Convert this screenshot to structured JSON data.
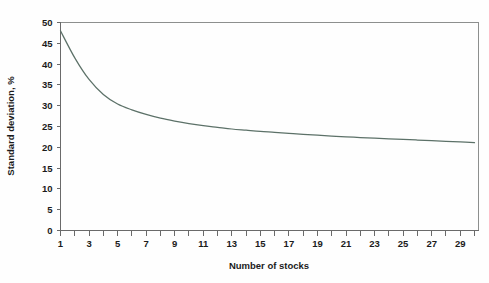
{
  "chart_data": {
    "type": "line",
    "title": "",
    "xlabel": "Number of stocks",
    "ylabel": "Standard deviation, %",
    "xlim": [
      1,
      30
    ],
    "ylim": [
      0,
      50
    ],
    "grid": false,
    "legend": null,
    "series_color": "#5c7168",
    "x": [
      1,
      2,
      3,
      4,
      5,
      6,
      7,
      8,
      9,
      10,
      11,
      12,
      13,
      14,
      15,
      16,
      17,
      18,
      19,
      20,
      21,
      22,
      23,
      24,
      25,
      26,
      27,
      28,
      29,
      30
    ],
    "values": [
      48.0,
      41.5,
      36.3,
      32.7,
      30.4,
      29.0,
      27.9,
      27.0,
      26.3,
      25.7,
      25.2,
      24.8,
      24.4,
      24.1,
      23.8,
      23.6,
      23.35,
      23.1,
      22.9,
      22.7,
      22.5,
      22.35,
      22.2,
      22.05,
      21.9,
      21.75,
      21.6,
      21.45,
      21.3,
      21.1
    ],
    "series": [
      {
        "name": "Portfolio standard deviation",
        "values": [
          48.0,
          41.5,
          36.3,
          32.7,
          30.4,
          29.0,
          27.9,
          27.0,
          26.3,
          25.7,
          25.2,
          24.8,
          24.4,
          24.1,
          23.8,
          23.6,
          23.35,
          23.1,
          22.9,
          22.7,
          22.5,
          22.35,
          22.2,
          22.05,
          21.9,
          21.75,
          21.6,
          21.45,
          21.3,
          21.1
        ]
      }
    ],
    "yticks": [
      0,
      5,
      10,
      15,
      20,
      25,
      30,
      35,
      40,
      45,
      50
    ],
    "ytick_labels": [
      "0",
      "5",
      "10",
      "15",
      "20",
      "25",
      "30",
      "35",
      "40",
      "45",
      "50"
    ],
    "xticks": [
      1,
      2,
      3,
      4,
      5,
      6,
      7,
      8,
      9,
      10,
      11,
      12,
      13,
      14,
      15,
      16,
      17,
      18,
      19,
      20,
      21,
      22,
      23,
      24,
      25,
      26,
      27,
      28,
      29,
      30
    ],
    "xtick_labels": [
      "1",
      "",
      "3",
      "",
      "5",
      "",
      "7",
      "",
      "9",
      "",
      "11",
      "",
      "13",
      "",
      "15",
      "",
      "17",
      "",
      "19",
      "",
      "21",
      "",
      "23",
      "",
      "25",
      "",
      "27",
      "",
      "29",
      ""
    ]
  },
  "axis": {
    "x_title": "Number of stocks",
    "y_title": "Standard deviation, %"
  },
  "colors": {
    "curve": "#5c7168",
    "axis": "#6a6a6a",
    "frame": "#8d8f8e",
    "text": "#1b1b1b",
    "background": "#fefefe"
  }
}
